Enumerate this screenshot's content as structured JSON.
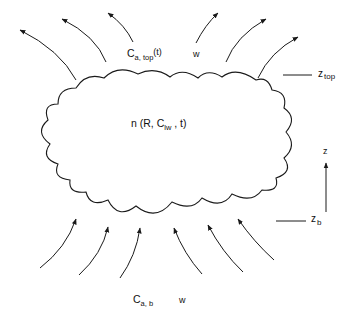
{
  "diagram": {
    "cloud": {
      "label_main": "n (R, C",
      "label_sub": "lw",
      "label_end": " , t)"
    },
    "top": {
      "conc_main": "C",
      "conc_sub": "a, top",
      "conc_end": "(t)",
      "velocity": "w",
      "height_main": "z",
      "height_sub": "top"
    },
    "bottom": {
      "conc_main": "C",
      "conc_sub": "a, b",
      "velocity": "w",
      "height_main": "z",
      "height_sub": "b"
    },
    "axis": {
      "label": "z"
    },
    "colors": {
      "line": "#1a1a1a",
      "background": "#ffffff"
    }
  }
}
